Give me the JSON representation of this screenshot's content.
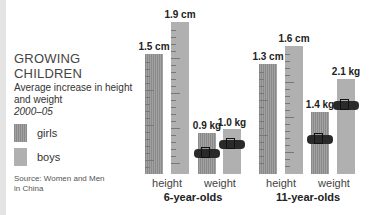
{
  "legend": {
    "title": "GROWING CHILDREN",
    "subtitle": "Average increase in height and weight",
    "years": "2000–05",
    "items": [
      {
        "label": "girls",
        "color": "#929292"
      },
      {
        "label": "boys",
        "color": "#b0b0b0"
      }
    ],
    "source": "Source: Women and Men in China"
  },
  "groups": [
    {
      "label": "6-year-olds",
      "xlabels": [
        "height",
        "weight"
      ],
      "bars": [
        {
          "label": "1.5 cm",
          "series": "girls",
          "metric": "height"
        },
        {
          "label": "1.9 cm",
          "series": "boys",
          "metric": "height"
        },
        {
          "label": "0.9 kg",
          "series": "girls",
          "metric": "weight"
        },
        {
          "label": "1.0 kg",
          "series": "boys",
          "metric": "weight"
        }
      ]
    },
    {
      "label": "11-year-olds",
      "xlabels": [
        "height",
        "weight"
      ],
      "bars": [
        {
          "label": "1.3 cm",
          "series": "girls",
          "metric": "height"
        },
        {
          "label": "1.6 cm",
          "series": "boys",
          "metric": "height"
        },
        {
          "label": "1.4 kg",
          "series": "girls",
          "metric": "weight"
        },
        {
          "label": "2.1 kg",
          "series": "boys",
          "metric": "weight"
        }
      ]
    }
  ],
  "chart_data": {
    "type": "bar",
    "title": "GROWING CHILDREN",
    "subtitle": "Average increase in height and weight 2000–05",
    "categories": [
      "6-year-olds height",
      "6-year-olds weight",
      "11-year-olds height",
      "11-year-olds weight"
    ],
    "series": [
      {
        "name": "girls",
        "values": [
          1.5,
          0.9,
          1.3,
          1.4
        ],
        "units": [
          "cm",
          "kg",
          "cm",
          "kg"
        ]
      },
      {
        "name": "boys",
        "values": [
          1.9,
          1.0,
          1.6,
          2.1
        ],
        "units": [
          "cm",
          "kg",
          "cm",
          "kg"
        ]
      }
    ],
    "group_labels": [
      "6-year-olds",
      "11-year-olds"
    ],
    "sub_labels": [
      "height",
      "weight"
    ],
    "legend": [
      "girls",
      "boys"
    ],
    "legend_position": "left",
    "source": "Source: Women and Men in China",
    "grid": false
  }
}
